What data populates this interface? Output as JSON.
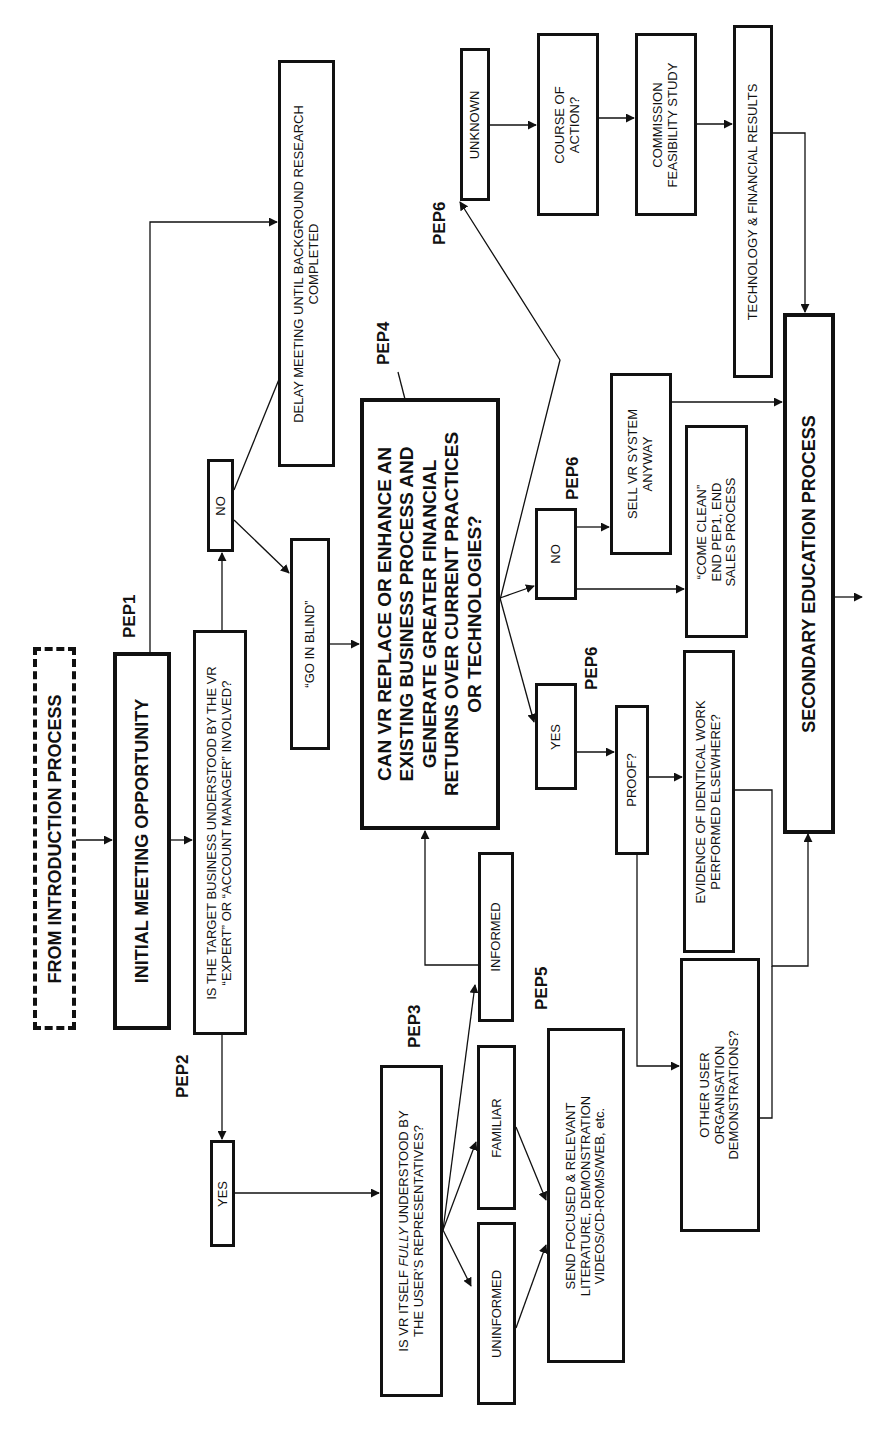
{
  "diagram": {
    "orientation": "rotated 90deg counter-clockwise (text reads bottom-to-top)",
    "line_color": "#111111",
    "background": "#ffffff"
  },
  "nodes": {
    "from_intro": {
      "lines": [
        "FROM INTRODUCTION PROCESS"
      ]
    },
    "initial_meeting": {
      "lines": [
        "INITIAL MEETING OPPORTUNITY"
      ]
    },
    "target_business": {
      "lines": [
        "IS THE TARGET BUSINESS UNDERSTOOD BY THE VR",
        "“EXPERT” OR “ACCOUNT MANAGER” INVOLVED?"
      ]
    },
    "no_1": {
      "lines": [
        "NO"
      ]
    },
    "delay_meeting": {
      "lines": [
        "DELAY MEETING UNTIL BACKGROUND RESEARCH",
        "COMPLETED"
      ]
    },
    "go_in_blind": {
      "lines": [
        "“GO IN BLIND”"
      ]
    },
    "can_vr_replace": {
      "lines": [
        "CAN VR REPLACE OR ENHANCE AN",
        "EXISTING BUSINESS PROCESS AND",
        "GENERATE GREATER FINANCIAL",
        "RETURNS OVER CURRENT PRACTICES",
        "OR TECHNOLOGIES?"
      ]
    },
    "yes_1": {
      "lines": [
        "YES"
      ]
    },
    "vr_understood": {
      "line1_pre": "IS VR ITSELF ",
      "line1_em": "FULLY",
      "line1_post": " UNDERSTOOD BY",
      "line2": "THE USER’S REPRESENTATIVES?"
    },
    "uninformed": {
      "lines": [
        "UNINFORMED"
      ]
    },
    "familiar": {
      "lines": [
        "FAMILIAR"
      ]
    },
    "informed": {
      "lines": [
        "INFORMED"
      ]
    },
    "send_focused": {
      "lines": [
        "SEND FOCUSED & RELEVANT",
        "LITERATURE, DEMONSTRATION",
        "VIDEOS/CD-ROMS/WEB, etc."
      ]
    },
    "yes_2": {
      "lines": [
        "YES"
      ]
    },
    "no_2": {
      "lines": [
        "NO"
      ]
    },
    "sell_anyway": {
      "lines": [
        "SELL VR SYSTEM",
        "ANYWAY"
      ]
    },
    "come_clean": {
      "lines": [
        "“COME CLEAN”",
        "END PEP1, END",
        "SALES PROCESS"
      ]
    },
    "proof": {
      "lines": [
        "PROOF?"
      ]
    },
    "evidence": {
      "lines": [
        "EVIDENCE OF IDENTICAL WORK",
        "PERFORMED ELSEWHERE?"
      ]
    },
    "other_user": {
      "lines": [
        "OTHER USER",
        "ORGANISATION",
        "DEMONSTRATIONS?"
      ]
    },
    "unknown": {
      "lines": [
        "UNKNOWN"
      ]
    },
    "course_of_action": {
      "lines": [
        "COURSE OF",
        "ACTION?"
      ]
    },
    "commission_study": {
      "lines": [
        "COMMISSION",
        "FEASIBILITY STUDY"
      ]
    },
    "tech_results": {
      "lines": [
        "TECHNOLOGY & FINANCIAL RESULTS"
      ]
    },
    "secondary_education": {
      "lines": [
        "SECONDARY EDUCATION PROCESS"
      ]
    }
  },
  "pep_labels": {
    "pep1": "PEP1",
    "pep2": "PEP2",
    "pep3": "PEP3",
    "pep4": "PEP4",
    "pep5": "PEP5",
    "pep6_unknown": "PEP6",
    "pep6_no": "PEP6",
    "pep6_yes": "PEP6"
  },
  "edges": [
    {
      "from": "from_intro",
      "to": "initial_meeting"
    },
    {
      "from": "initial_meeting",
      "to": "target_business"
    },
    {
      "from": "initial_meeting",
      "to": "delay_meeting"
    },
    {
      "from": "target_business",
      "to": "no_1"
    },
    {
      "from": "target_business",
      "to": "yes_1"
    },
    {
      "from": "no_1",
      "to": "delay_meeting"
    },
    {
      "from": "no_1",
      "to": "go_in_blind"
    },
    {
      "from": "go_in_blind",
      "to": "can_vr_replace"
    },
    {
      "from": "yes_1",
      "to": "vr_understood"
    },
    {
      "from": "vr_understood",
      "to": "uninformed"
    },
    {
      "from": "vr_understood",
      "to": "familiar"
    },
    {
      "from": "vr_understood",
      "to": "informed"
    },
    {
      "from": "informed",
      "to": "can_vr_replace"
    },
    {
      "from": "uninformed",
      "to": "send_focused"
    },
    {
      "from": "familiar",
      "to": "send_focused"
    },
    {
      "from": "can_vr_replace",
      "to": "unknown"
    },
    {
      "from": "can_vr_replace",
      "to": "no_2"
    },
    {
      "from": "can_vr_replace",
      "to": "yes_2"
    },
    {
      "from": "unknown",
      "to": "course_of_action"
    },
    {
      "from": "course_of_action",
      "to": "commission_study"
    },
    {
      "from": "commission_study",
      "to": "tech_results"
    },
    {
      "from": "tech_results",
      "to": "secondary_education"
    },
    {
      "from": "no_2",
      "to": "sell_anyway"
    },
    {
      "from": "no_2",
      "to": "come_clean"
    },
    {
      "from": "sell_anyway",
      "to": "secondary_education"
    },
    {
      "from": "yes_2",
      "to": "proof"
    },
    {
      "from": "proof",
      "to": "evidence"
    },
    {
      "from": "proof",
      "to": "other_user"
    },
    {
      "from": "evidence",
      "to": "secondary_education"
    },
    {
      "from": "other_user",
      "to": "secondary_education"
    },
    {
      "from": "secondary_education",
      "to": "exit"
    }
  ]
}
